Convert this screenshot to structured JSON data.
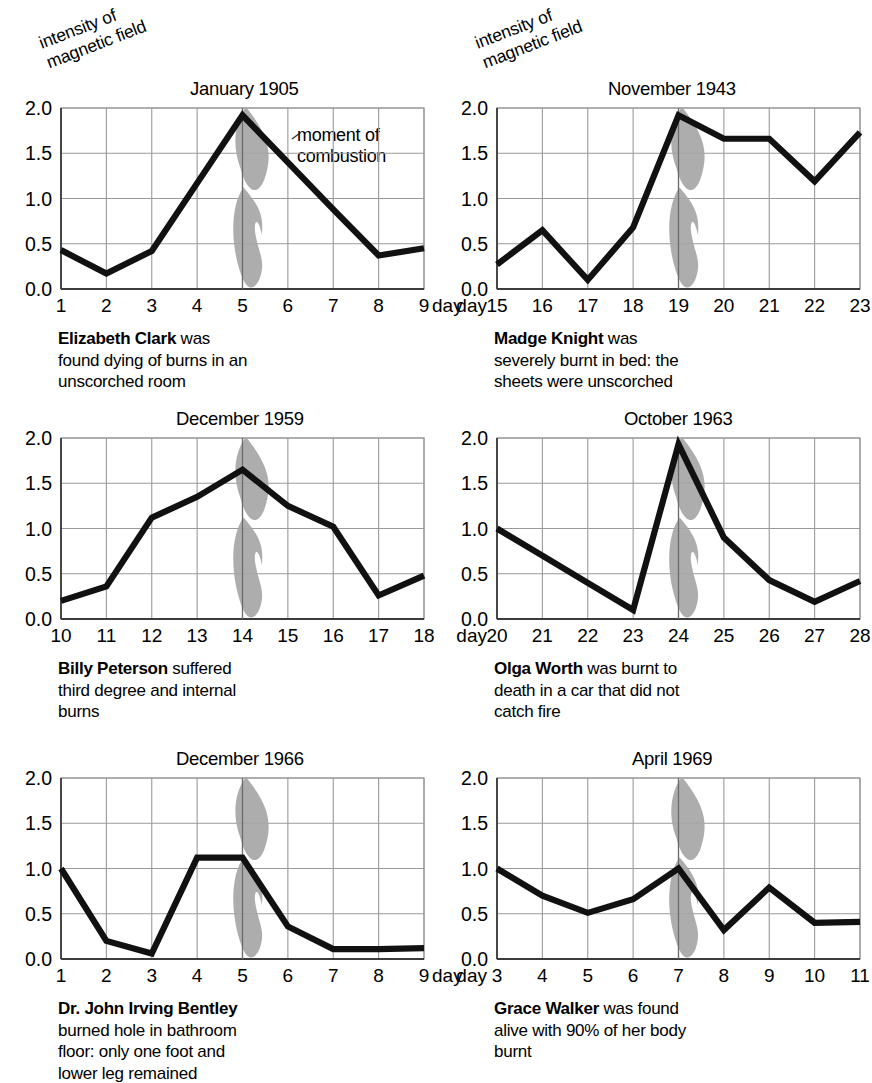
{
  "figure": {
    "axis_caption": "intensity of\nmagnetic field",
    "annotation": "moment of\ncombustion",
    "day_prefix": "day",
    "colors": {
      "line": "#111111",
      "grid": "#9a9a9a",
      "axis": "#555555",
      "flame": "#a6a6a6",
      "text": "#000000"
    }
  },
  "chart_data": [
    {
      "type": "line",
      "title": "January 1905",
      "xlabel": "day",
      "ylabel": "intensity of magnetic field",
      "x": [
        1,
        2,
        3,
        4,
        5,
        6,
        7,
        8,
        9
      ],
      "xtick_labels": [
        "1",
        "2",
        "3",
        "4",
        "5",
        "6",
        "7",
        "8",
        "9"
      ],
      "values": [
        0.43,
        0.17,
        0.42,
        1.17,
        1.92,
        1.4,
        0.88,
        0.37,
        0.45
      ],
      "ylim": [
        0.0,
        2.0
      ],
      "yticks": [
        0.0,
        0.5,
        1.0,
        1.5,
        2.0
      ],
      "ytick_labels": [
        "0.0",
        "0.5",
        "1.0",
        "1.5",
        "2.0"
      ],
      "grid": true,
      "combustion_day": 5,
      "annotation": "moment of\ncombustion",
      "day_label_side": "right",
      "caption_bold": "Elizabeth Clark",
      "caption_rest": " was\nfound dying of burns in an\nunscorched room"
    },
    {
      "type": "line",
      "title": "November 1943",
      "xlabel": "day",
      "ylabel": "intensity of magnetic field",
      "x": [
        15,
        16,
        17,
        18,
        19,
        20,
        21,
        22,
        23
      ],
      "xtick_labels": [
        "15",
        "16",
        "17",
        "18",
        "19",
        "20",
        "21",
        "22",
        "23"
      ],
      "values": [
        0.27,
        0.65,
        0.1,
        0.68,
        1.92,
        1.66,
        1.66,
        1.19,
        1.73
      ],
      "ylim": [
        0.0,
        2.0
      ],
      "yticks": [
        0.0,
        0.5,
        1.0,
        1.5,
        2.0
      ],
      "ytick_labels": [
        "0.0",
        "0.5",
        "1.0",
        "1.5",
        "2.0"
      ],
      "grid": true,
      "combustion_day": 19,
      "annotation": "",
      "day_label_side": "left",
      "caption_bold": "Madge Knight",
      "caption_rest": " was\nseverely burnt in bed: the\nsheets were unscorched"
    },
    {
      "type": "line",
      "title": "December 1959",
      "xlabel": "day",
      "ylabel": "intensity of magnetic field",
      "x": [
        10,
        11,
        12,
        13,
        14,
        15,
        16,
        17,
        18
      ],
      "xtick_labels": [
        "10",
        "11",
        "12",
        "13",
        "14",
        "15",
        "16",
        "17",
        "18"
      ],
      "values": [
        0.2,
        0.36,
        1.12,
        1.35,
        1.65,
        1.25,
        1.02,
        0.26,
        0.48
      ],
      "ylim": [
        0.0,
        2.0
      ],
      "yticks": [
        0.0,
        0.5,
        1.0,
        1.5,
        2.0
      ],
      "ytick_labels": [
        "0.0",
        "0.5",
        "1.0",
        "1.5",
        "2.0"
      ],
      "grid": true,
      "combustion_day": 14,
      "annotation": "",
      "day_label_side": "none",
      "caption_bold": "Billy Peterson",
      "caption_rest": " suffered\nthird degree and internal\nburns"
    },
    {
      "type": "line",
      "title": "October 1963",
      "xlabel": "day",
      "ylabel": "intensity of magnetic field",
      "x": [
        20,
        21,
        22,
        23,
        24,
        25,
        26,
        27,
        28
      ],
      "xtick_labels": [
        "20",
        "21",
        "22",
        "23",
        "24",
        "25",
        "26",
        "27",
        "28"
      ],
      "values": [
        1.0,
        0.7,
        0.4,
        0.1,
        1.93,
        0.9,
        0.43,
        0.19,
        0.42
      ],
      "ylim": [
        0.0,
        2.0
      ],
      "yticks": [
        0.0,
        0.5,
        1.0,
        1.5,
        2.0
      ],
      "ytick_labels": [
        "0.0",
        "0.5",
        "1.0",
        "1.5",
        "2.0"
      ],
      "grid": true,
      "combustion_day": 24,
      "annotation": "",
      "day_label_side": "left",
      "caption_bold": "Olga Worth",
      "caption_rest": " was burnt to\ndeath in a car that did not\ncatch fire"
    },
    {
      "type": "line",
      "title": "December 1966",
      "xlabel": "day",
      "ylabel": "intensity of magnetic field",
      "x": [
        1,
        2,
        3,
        4,
        5,
        6,
        7,
        8,
        9
      ],
      "xtick_labels": [
        "1",
        "2",
        "3",
        "4",
        "5",
        "6",
        "7",
        "8",
        "9"
      ],
      "values": [
        1.0,
        0.2,
        0.06,
        1.12,
        1.12,
        0.36,
        0.11,
        0.11,
        0.12
      ],
      "ylim": [
        0.0,
        2.0
      ],
      "yticks": [
        0.0,
        0.5,
        1.0,
        1.5,
        2.0
      ],
      "ytick_labels": [
        "0.0",
        "0.5",
        "1.0",
        "1.5",
        "2.0"
      ],
      "grid": true,
      "combustion_day": 5,
      "annotation": "",
      "day_label_side": "right",
      "caption_bold": "Dr. John Irving Bentley",
      "caption_rest": "\nburned hole in bathroom\nfloor: only one foot and\nlower leg remained"
    },
    {
      "type": "line",
      "title": "April 1969",
      "xlabel": "day",
      "ylabel": "intensity of magnetic field",
      "x": [
        3,
        4,
        5,
        6,
        7,
        8,
        9,
        10,
        11
      ],
      "xtick_labels": [
        "3",
        "4",
        "5",
        "6",
        "7",
        "8",
        "9",
        "10",
        "11"
      ],
      "values": [
        1.0,
        0.7,
        0.51,
        0.66,
        1.0,
        0.32,
        0.79,
        0.4,
        0.41
      ],
      "ylim": [
        0.0,
        2.0
      ],
      "yticks": [
        0.0,
        0.5,
        1.0,
        1.5,
        2.0
      ],
      "ytick_labels": [
        "0.0",
        "0.5",
        "1.0",
        "1.5",
        "2.0"
      ],
      "grid": true,
      "combustion_day": 7,
      "annotation": "",
      "day_label_side": "left",
      "caption_bold": "Grace Walker",
      "caption_rest": " was found\nalive with 90% of her body\nburnt"
    }
  ]
}
